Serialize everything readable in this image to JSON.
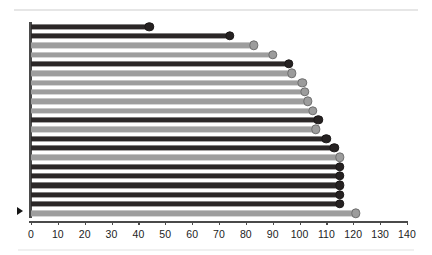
{
  "chart_data": {
    "type": "bar",
    "subtype": "horizontal-lollipop",
    "title": "",
    "subtitle": "",
    "xlabel": "",
    "ylabel": "",
    "xlim": [
      0,
      140
    ],
    "ylim": [
      0,
      21
    ],
    "grid": false,
    "legend": false,
    "legend_position": "none",
    "orientation": "horizontal",
    "x_tick_step": 10,
    "x_tick_labels": [
      "0",
      "10",
      "20",
      "30",
      "40",
      "50",
      "60",
      "70",
      "80",
      "90",
      "100",
      "110",
      "120",
      "130",
      "140"
    ],
    "x_tick_values": [
      0,
      10,
      20,
      30,
      40,
      50,
      60,
      70,
      80,
      90,
      100,
      110,
      120,
      130,
      140
    ],
    "y_tick_labels": [],
    "categories": [
      "row-1",
      "row-2",
      "row-3",
      "row-4",
      "row-5",
      "row-6",
      "row-7",
      "row-8",
      "row-9",
      "row-10",
      "row-11",
      "row-12",
      "row-13",
      "row-14",
      "row-15",
      "row-16",
      "row-17",
      "row-18",
      "row-19",
      "row-20",
      "row-21"
    ],
    "values": [
      44,
      74,
      83,
      90,
      96,
      97,
      101,
      102,
      103,
      105,
      107,
      106,
      110,
      113,
      115,
      115,
      115,
      115,
      115,
      115,
      121
    ],
    "point_colors": [
      "dark",
      "dark",
      "light",
      "light",
      "dark",
      "light",
      "light",
      "light",
      "light",
      "light",
      "dark",
      "light",
      "dark",
      "dark",
      "light",
      "dark",
      "dark",
      "dark",
      "dark",
      "dark",
      "light"
    ],
    "series": [
      {
        "name": "dark",
        "color": "#262222",
        "points": [
          {
            "category": "row-1",
            "value": 44
          },
          {
            "category": "row-2",
            "value": 74
          },
          {
            "category": "row-5",
            "value": 96
          },
          {
            "category": "row-11",
            "value": 107
          },
          {
            "category": "row-13",
            "value": 110
          },
          {
            "category": "row-14",
            "value": 113
          },
          {
            "category": "row-16",
            "value": 115
          },
          {
            "category": "row-17",
            "value": 115
          },
          {
            "category": "row-18",
            "value": 115
          },
          {
            "category": "row-19",
            "value": 115
          },
          {
            "category": "row-20",
            "value": 115
          }
        ]
      },
      {
        "name": "light",
        "color": "#9c9c9c",
        "points": [
          {
            "category": "row-3",
            "value": 83
          },
          {
            "category": "row-4",
            "value": 90
          },
          {
            "category": "row-6",
            "value": 97
          },
          {
            "category": "row-7",
            "value": 101
          },
          {
            "category": "row-8",
            "value": 102
          },
          {
            "category": "row-9",
            "value": 103
          },
          {
            "category": "row-10",
            "value": 105
          },
          {
            "category": "row-12",
            "value": 106
          },
          {
            "category": "row-15",
            "value": 115
          },
          {
            "category": "row-21",
            "value": 121
          }
        ]
      }
    ],
    "annotations": [
      {
        "name": "origin-marker",
        "symbol": "▶",
        "at_value": 0,
        "at_category": "row-21"
      }
    ],
    "colors": {
      "dark": "#262222",
      "light": "#9c9c9c",
      "axis": "#4a4a4a",
      "background": "#ffffff",
      "tick_label": "#1d1d1d"
    }
  }
}
